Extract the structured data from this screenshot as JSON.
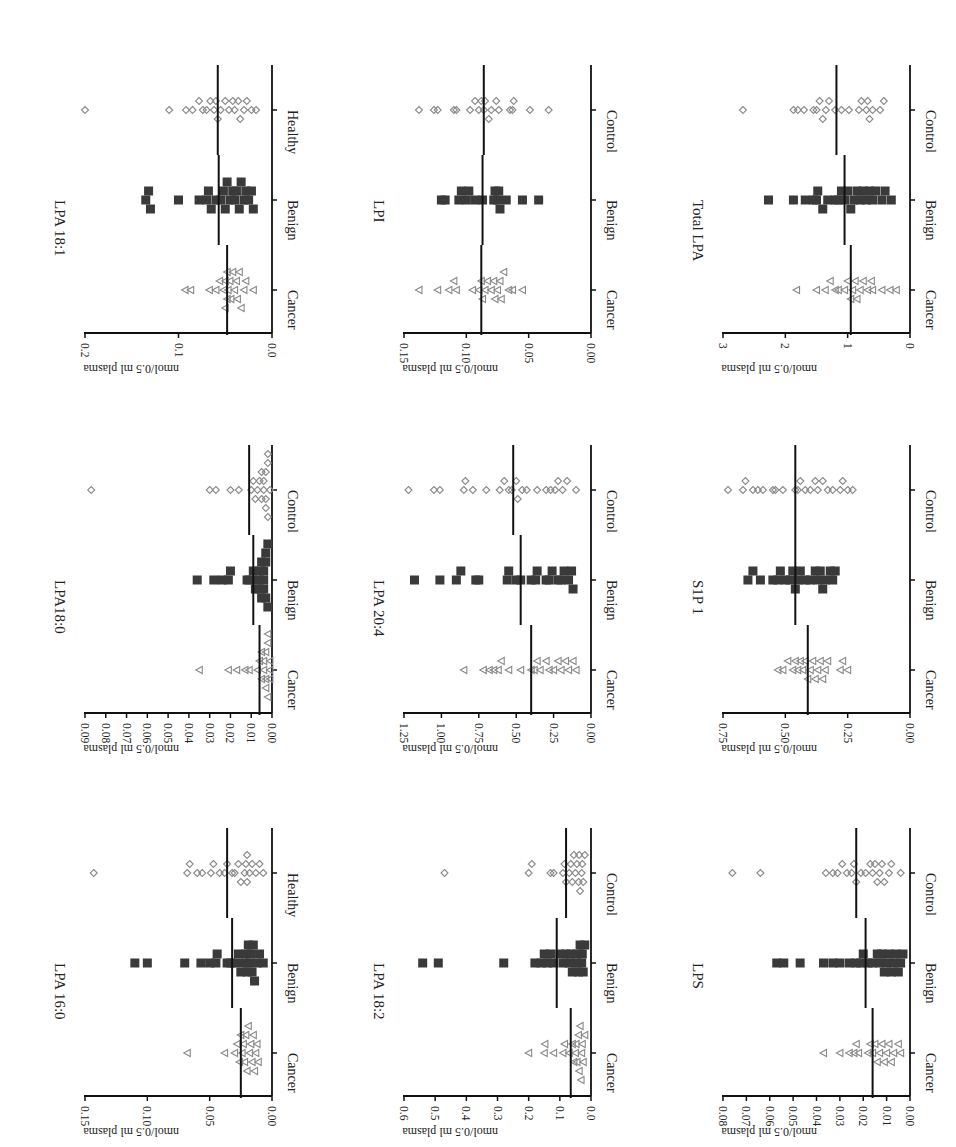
{
  "figure": {
    "y_axis_label": "nmol/0.5 ml plasma",
    "colors": {
      "cancer": "#8a8a8a",
      "benign": "#3a3a3a",
      "control": "#8a8a8a",
      "axis": "#111111",
      "mean": "#111111"
    }
  },
  "chart_data": [
    {
      "type": "scatter",
      "title": "LPA 18:1",
      "categories": [
        "Cancer",
        "Benign",
        "Healthy"
      ],
      "ylabel": "nmol/0.5 ml plasma",
      "ylim": [
        0,
        0.2
      ],
      "ticks": [
        "0.0",
        "0.1",
        "0.2"
      ],
      "tick_values": [
        0,
        0.1,
        0.2
      ],
      "means": [
        0.048,
        0.057,
        0.058
      ],
      "series": [
        {
          "name": "Cancer",
          "marker": "triangle",
          "values": [
            0.093,
            0.087,
            0.067,
            0.06,
            0.056,
            0.052,
            0.05,
            0.048,
            0.047,
            0.045,
            0.044,
            0.042,
            0.04,
            0.038,
            0.037,
            0.035,
            0.033,
            0.03,
            0.028,
            0.02,
            0.048,
            0.05
          ]
        },
        {
          "name": "Benign",
          "marker": "square",
          "values": [
            0.135,
            0.132,
            0.13,
            0.1,
            0.078,
            0.07,
            0.068,
            0.065,
            0.06,
            0.055,
            0.052,
            0.05,
            0.048,
            0.045,
            0.042,
            0.04,
            0.038,
            0.035,
            0.033,
            0.03,
            0.028,
            0.025,
            0.022,
            0.02
          ]
        },
        {
          "name": "Healthy",
          "marker": "diamond",
          "values": [
            0.2,
            0.11,
            0.092,
            0.085,
            0.078,
            0.074,
            0.07,
            0.066,
            0.062,
            0.06,
            0.058,
            0.055,
            0.05,
            0.046,
            0.042,
            0.04,
            0.036,
            0.034,
            0.03,
            0.027,
            0.022,
            0.017
          ]
        }
      ]
    },
    {
      "type": "scatter",
      "title": "LPI",
      "categories": [
        "Cancer",
        "Benign",
        "Control"
      ],
      "ylabel": "nmol/0.5 ml plasma",
      "ylim": [
        0,
        0.15
      ],
      "ticks": [
        "0.00",
        "0.05",
        "0.10",
        "0.15"
      ],
      "tick_values": [
        0,
        0.05,
        0.1,
        0.15
      ],
      "means": [
        0.088,
        0.087,
        0.086
      ],
      "series": [
        {
          "name": "Cancer",
          "marker": "triangle",
          "values": [
            0.138,
            0.123,
            0.114,
            0.11,
            0.108,
            0.095,
            0.09,
            0.088,
            0.087,
            0.085,
            0.083,
            0.08,
            0.078,
            0.077,
            0.075,
            0.073,
            0.072,
            0.07,
            0.066,
            0.063,
            0.055
          ]
        },
        {
          "name": "Benign",
          "marker": "square",
          "values": [
            0.12,
            0.117,
            0.106,
            0.104,
            0.1,
            0.098,
            0.093,
            0.087,
            0.078,
            0.077,
            0.075,
            0.074,
            0.073,
            0.068,
            0.055,
            0.042
          ]
        },
        {
          "name": "Control",
          "marker": "diamond",
          "values": [
            0.138,
            0.126,
            0.123,
            0.11,
            0.108,
            0.097,
            0.093,
            0.09,
            0.088,
            0.086,
            0.085,
            0.082,
            0.08,
            0.076,
            0.074,
            0.065,
            0.063,
            0.062,
            0.049,
            0.034
          ]
        }
      ]
    },
    {
      "type": "scatter",
      "title": "Total LPA",
      "categories": [
        "Cancer",
        "Benign",
        "Control"
      ],
      "ylabel": "nmol/0.5 ml plasma",
      "ylim": [
        0,
        3
      ],
      "ticks": [
        "0",
        "1",
        "2",
        "3"
      ],
      "tick_values": [
        0,
        1,
        2,
        3
      ],
      "means": [
        0.95,
        1.05,
        1.18
      ],
      "series": [
        {
          "name": "Cancer",
          "marker": "triangle",
          "values": [
            1.82,
            1.5,
            1.36,
            1.28,
            1.2,
            1.15,
            1.05,
            1.0,
            0.95,
            0.92,
            0.88,
            0.85,
            0.8,
            0.75,
            0.68,
            0.62,
            0.6,
            0.45,
            0.32,
            0.22
          ]
        },
        {
          "name": "Benign",
          "marker": "square",
          "values": [
            2.27,
            1.87,
            1.68,
            1.55,
            1.5,
            1.48,
            1.4,
            1.32,
            1.2,
            1.15,
            1.1,
            1.05,
            1.0,
            0.95,
            0.9,
            0.85,
            0.8,
            0.75,
            0.7,
            0.65,
            0.6,
            0.55,
            0.45,
            0.4,
            0.3
          ]
        },
        {
          "name": "Control",
          "marker": "diamond",
          "values": [
            2.68,
            1.87,
            1.8,
            1.7,
            1.55,
            1.5,
            1.45,
            1.4,
            1.35,
            1.3,
            1.2,
            1.1,
            0.98,
            0.82,
            0.78,
            0.7,
            0.68,
            0.65,
            0.6,
            0.48,
            0.42
          ]
        }
      ]
    },
    {
      "type": "scatter",
      "title": "LPA18:0",
      "categories": [
        "Cancer",
        "Benign",
        "Control"
      ],
      "ylabel": "nmol/0.5 ml plasma",
      "ylim": [
        0,
        0.09
      ],
      "ticks": [
        "0.00",
        "0.01",
        "0.02",
        "0.03",
        "0.04",
        "0.05",
        "0.06",
        "0.07",
        "0.08",
        "0.09"
      ],
      "tick_values": [
        0,
        0.01,
        0.02,
        0.03,
        0.04,
        0.05,
        0.06,
        0.07,
        0.08,
        0.09
      ],
      "means": [
        0.006,
        0.009,
        0.011
      ],
      "series": [
        {
          "name": "Cancer",
          "marker": "triangle",
          "values": [
            0.035,
            0.021,
            0.017,
            0.013,
            0.011,
            0.007,
            0.006,
            0.005,
            0.005,
            0.004,
            0.004,
            0.003,
            0.003,
            0.003,
            0.002,
            0.002,
            0.002,
            0.001,
            0.001,
            0.001
          ]
        },
        {
          "name": "Benign",
          "marker": "square",
          "values": [
            0.036,
            0.028,
            0.024,
            0.021,
            0.02,
            0.012,
            0.011,
            0.009,
            0.008,
            0.007,
            0.006,
            0.006,
            0.005,
            0.005,
            0.004,
            0.004,
            0.004,
            0.003,
            0.003,
            0.003,
            0.002,
            0.002
          ]
        },
        {
          "name": "Control",
          "marker": "diamond",
          "values": [
            0.087,
            0.03,
            0.027,
            0.02,
            0.016,
            0.01,
            0.009,
            0.008,
            0.007,
            0.006,
            0.005,
            0.005,
            0.004,
            0.004,
            0.003,
            0.003,
            0.003,
            0.002,
            0.002,
            0.002,
            0.001
          ]
        }
      ]
    },
    {
      "type": "scatter",
      "title": "LPA 20:4",
      "categories": [
        "Cancer",
        "Benign",
        "Control"
      ],
      "ylabel": "nmol/0.5 ml plasma",
      "ylim": [
        0,
        1.25
      ],
      "ticks": [
        "0.00",
        "0.25",
        "0.50",
        "0.75",
        "1.00",
        "1.25"
      ],
      "tick_values": [
        0,
        0.25,
        0.5,
        0.75,
        1.0,
        1.25
      ],
      "means": [
        0.4,
        0.47,
        0.52
      ],
      "series": [
        {
          "name": "Cancer",
          "marker": "triangle",
          "values": [
            0.85,
            0.72,
            0.68,
            0.65,
            0.62,
            0.6,
            0.55,
            0.47,
            0.4,
            0.38,
            0.36,
            0.34,
            0.3,
            0.28,
            0.25,
            0.22,
            0.2,
            0.17,
            0.15,
            0.12,
            0.1
          ]
        },
        {
          "name": "Benign",
          "marker": "square",
          "values": [
            1.18,
            1.01,
            0.9,
            0.87,
            0.77,
            0.75,
            0.56,
            0.55,
            0.5,
            0.47,
            0.4,
            0.37,
            0.36,
            0.3,
            0.28,
            0.26,
            0.22,
            0.2,
            0.18,
            0.15,
            0.13,
            0.12
          ]
        },
        {
          "name": "Control",
          "marker": "diamond",
          "values": [
            1.22,
            1.05,
            1.01,
            0.85,
            0.84,
            0.79,
            0.7,
            0.61,
            0.58,
            0.55,
            0.53,
            0.5,
            0.49,
            0.46,
            0.43,
            0.36,
            0.3,
            0.27,
            0.24,
            0.22,
            0.19,
            0.16,
            0.1
          ]
        }
      ]
    },
    {
      "type": "scatter",
      "title": "S1P 1",
      "categories": [
        "Cancer",
        "Benign",
        "Control"
      ],
      "ylabel": "nmol/0.5 ml plasma",
      "ylim": [
        0,
        0.75
      ],
      "ticks": [
        "0.00",
        "0.25",
        "0.50",
        "0.75"
      ],
      "tick_values": [
        0,
        0.25,
        0.5,
        0.75
      ],
      "means": [
        0.41,
        0.46,
        0.46
      ],
      "series": [
        {
          "name": "Cancer",
          "marker": "triangle",
          "values": [
            0.53,
            0.51,
            0.49,
            0.47,
            0.46,
            0.45,
            0.44,
            0.43,
            0.42,
            0.41,
            0.4,
            0.39,
            0.38,
            0.37,
            0.36,
            0.35,
            0.34,
            0.33,
            0.28,
            0.27,
            0.25
          ]
        },
        {
          "name": "Benign",
          "marker": "square",
          "values": [
            0.65,
            0.63,
            0.6,
            0.55,
            0.53,
            0.52,
            0.5,
            0.48,
            0.47,
            0.46,
            0.45,
            0.44,
            0.42,
            0.4,
            0.38,
            0.37,
            0.36,
            0.35,
            0.34,
            0.32,
            0.31,
            0.3
          ]
        },
        {
          "name": "Control",
          "marker": "diamond",
          "values": [
            0.73,
            0.67,
            0.66,
            0.63,
            0.61,
            0.59,
            0.55,
            0.54,
            0.51,
            0.46,
            0.45,
            0.44,
            0.42,
            0.4,
            0.38,
            0.37,
            0.35,
            0.33,
            0.31,
            0.28,
            0.27,
            0.25,
            0.23
          ]
        }
      ]
    },
    {
      "type": "scatter",
      "title": "LPA 16:0",
      "categories": [
        "Cancer",
        "Benign",
        "Healthy"
      ],
      "ylabel": "nmol/0.5 ml plasma",
      "ylim": [
        0,
        0.15
      ],
      "ticks": [
        "0.00",
        "0.05",
        "0.10",
        "0.15"
      ],
      "tick_values": [
        0,
        0.05,
        0.1,
        0.15
      ],
      "means": [
        0.025,
        0.032,
        0.036
      ],
      "series": [
        {
          "name": "Cancer",
          "marker": "triangle",
          "values": [
            0.068,
            0.038,
            0.03,
            0.028,
            0.026,
            0.025,
            0.024,
            0.023,
            0.022,
            0.021,
            0.02,
            0.019,
            0.018,
            0.017,
            0.016,
            0.015,
            0.014,
            0.013,
            0.012,
            0.011
          ]
        },
        {
          "name": "Benign",
          "marker": "square",
          "values": [
            0.11,
            0.1,
            0.07,
            0.057,
            0.05,
            0.045,
            0.044,
            0.036,
            0.033,
            0.03,
            0.027,
            0.025,
            0.023,
            0.021,
            0.02,
            0.019,
            0.018,
            0.017,
            0.016,
            0.015,
            0.014,
            0.012,
            0.01,
            0.007
          ]
        },
        {
          "name": "Healthy",
          "marker": "diamond",
          "values": [
            0.143,
            0.068,
            0.066,
            0.06,
            0.056,
            0.049,
            0.047,
            0.042,
            0.038,
            0.036,
            0.032,
            0.03,
            0.027,
            0.025,
            0.022,
            0.021,
            0.02,
            0.02,
            0.018,
            0.016,
            0.013,
            0.01,
            0.007
          ]
        }
      ]
    },
    {
      "type": "scatter",
      "title": "LPA 18:2",
      "categories": [
        "Cancer",
        "Benign",
        "Control"
      ],
      "ylabel": "nmol/0.5 ml plasma",
      "ylim": [
        0,
        0.6
      ],
      "ticks": [
        "0.0",
        "0.1",
        "0.2",
        "0.3",
        "0.4",
        "0.5",
        "0.6"
      ],
      "tick_values": [
        0,
        0.1,
        0.2,
        0.3,
        0.4,
        0.5,
        0.6
      ],
      "means": [
        0.065,
        0.11,
        0.08
      ],
      "series": [
        {
          "name": "Cancer",
          "marker": "triangle",
          "values": [
            0.2,
            0.15,
            0.148,
            0.12,
            0.09,
            0.085,
            0.07,
            0.06,
            0.055,
            0.05,
            0.048,
            0.045,
            0.04,
            0.038,
            0.035,
            0.032,
            0.03,
            0.028,
            0.025,
            0.02
          ]
        },
        {
          "name": "Benign",
          "marker": "square",
          "values": [
            0.54,
            0.49,
            0.28,
            0.18,
            0.16,
            0.15,
            0.14,
            0.13,
            0.12,
            0.1,
            0.09,
            0.08,
            0.07,
            0.065,
            0.06,
            0.05,
            0.045,
            0.04,
            0.035,
            0.03,
            0.028,
            0.025,
            0.02
          ]
        },
        {
          "name": "Control",
          "marker": "diamond",
          "values": [
            0.47,
            0.2,
            0.19,
            0.13,
            0.12,
            0.09,
            0.085,
            0.08,
            0.07,
            0.065,
            0.06,
            0.055,
            0.05,
            0.045,
            0.04,
            0.038,
            0.035,
            0.03,
            0.028,
            0.025,
            0.02
          ]
        }
      ]
    },
    {
      "type": "scatter",
      "title": "LPS",
      "categories": [
        "Cancer",
        "Benign",
        "Control"
      ],
      "ylabel": "nmol/0.5 ml plasma",
      "ylim": [
        0,
        0.08
      ],
      "ticks": [
        "0.00",
        "0.01",
        "0.02",
        "0.03",
        "0.04",
        "0.05",
        "0.06",
        "0.07",
        "0.08"
      ],
      "tick_values": [
        0,
        0.01,
        0.02,
        0.03,
        0.04,
        0.05,
        0.06,
        0.07,
        0.08
      ],
      "means": [
        0.016,
        0.019,
        0.023
      ],
      "series": [
        {
          "name": "Cancer",
          "marker": "triangle",
          "values": [
            0.037,
            0.03,
            0.026,
            0.024,
            0.023,
            0.022,
            0.018,
            0.017,
            0.016,
            0.015,
            0.014,
            0.013,
            0.012,
            0.011,
            0.01,
            0.009,
            0.008,
            0.007,
            0.005,
            0.004
          ]
        },
        {
          "name": "Benign",
          "marker": "square",
          "values": [
            0.057,
            0.054,
            0.047,
            0.037,
            0.033,
            0.03,
            0.026,
            0.023,
            0.021,
            0.02,
            0.018,
            0.016,
            0.014,
            0.013,
            0.012,
            0.011,
            0.01,
            0.009,
            0.008,
            0.007,
            0.006,
            0.005,
            0.004,
            0.003
          ]
        },
        {
          "name": "Control",
          "marker": "diamond",
          "values": [
            0.076,
            0.064,
            0.036,
            0.033,
            0.031,
            0.029,
            0.027,
            0.025,
            0.024,
            0.023,
            0.021,
            0.019,
            0.017,
            0.016,
            0.015,
            0.014,
            0.013,
            0.012,
            0.011,
            0.009,
            0.008,
            0.004
          ]
        }
      ]
    }
  ]
}
